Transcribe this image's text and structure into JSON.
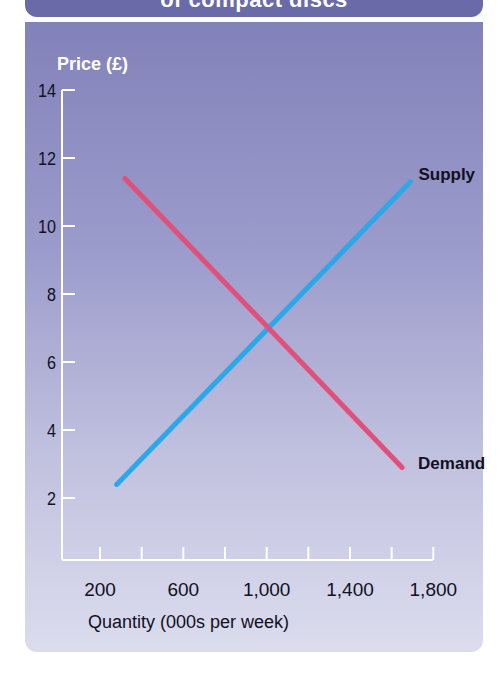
{
  "header": {
    "title": "of compact discs"
  },
  "chart_data": {
    "type": "line",
    "title": "of compact discs",
    "xlabel": "Quantity (000s per week)",
    "ylabel": "Price (£)",
    "xlim": [
      200,
      1800
    ],
    "ylim": [
      0,
      14
    ],
    "x_ticks": [
      200,
      400,
      600,
      800,
      1000,
      1200,
      1400,
      1600,
      1800
    ],
    "x_tick_labels": [
      "200",
      "600",
      "1,000",
      "1,400",
      "1,800"
    ],
    "x_tick_label_values": [
      200,
      600,
      1000,
      1400,
      1800
    ],
    "y_ticks": [
      2,
      4,
      6,
      8,
      10,
      12,
      14
    ],
    "y_tick_labels": [
      "2",
      "4",
      "6",
      "8",
      "10",
      "12",
      "14"
    ],
    "grid": false,
    "legend": "inline labels at line ends",
    "series": [
      {
        "name": "Supply",
        "color": "#2aa8e8",
        "x": [
          280,
          1690
        ],
        "y": [
          2.4,
          11.3
        ]
      },
      {
        "name": "Demand",
        "color": "#e0507a",
        "x": [
          320,
          1650
        ],
        "y": [
          11.4,
          2.9
        ]
      }
    ],
    "equilibrium": {
      "quantity": 1000,
      "price": 7
    }
  },
  "labels": {
    "supply": "Supply",
    "demand": "Demand",
    "y_axis_title": "Price (£)",
    "x_axis_title": "Quantity (000s per week)"
  }
}
